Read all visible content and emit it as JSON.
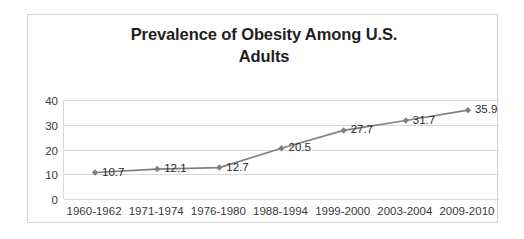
{
  "top_cutoff_text": "",
  "chart_data": {
    "type": "line",
    "title": "Prevalence of Obesity Among U.S. Adults",
    "title_lines": [
      "Prevalence of Obesity Among U.S.",
      "Adults"
    ],
    "xlabel": "",
    "ylabel": "",
    "categories": [
      "1960-1962",
      "1971-1974",
      "1976-1980",
      "1988-1994",
      "1999-2000",
      "2003-2004",
      "2009-2010"
    ],
    "values": [
      10.7,
      12.1,
      12.7,
      20.5,
      27.7,
      31.7,
      35.9
    ],
    "data_labels": [
      "10.7",
      "12.1",
      "12.7",
      "20.5",
      "27.7",
      "31.7",
      "35.9"
    ],
    "ylim": [
      0,
      40
    ],
    "y_ticks": [
      0,
      10,
      20,
      30,
      40
    ],
    "y_tick_labels": [
      "0",
      "10",
      "20",
      "30",
      "40"
    ],
    "grid": true,
    "legend": false,
    "legend_position": "none",
    "series_color": "#808080",
    "marker": "diamond",
    "marker_color": "#808080",
    "gridline_color": "#d9d9d9",
    "border_color": "#d4d4d4",
    "title_color": "#1f1f1f",
    "label_color": "#3a3a3a"
  }
}
